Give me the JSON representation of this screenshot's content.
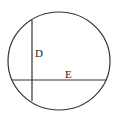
{
  "diagram": {
    "type": "circle-with-chords",
    "colors": {
      "stroke": "#333333",
      "background": "#ffffff",
      "text": "#222222"
    },
    "circle": {
      "cx": 59,
      "cy": 61,
      "rx": 51,
      "ry": 49
    },
    "chords": [
      {
        "name": "vertical-chord",
        "x1": 32,
        "y1": 20,
        "x2": 32,
        "y2": 101
      },
      {
        "name": "horizontal-chord",
        "x1": 12,
        "y1": 80,
        "x2": 106,
        "y2": 80
      }
    ],
    "labels": [
      {
        "name": "label-d",
        "text": "D",
        "x": 35,
        "y": 57
      },
      {
        "name": "label-e",
        "text": "E",
        "x": 65,
        "y": 78
      }
    ]
  }
}
